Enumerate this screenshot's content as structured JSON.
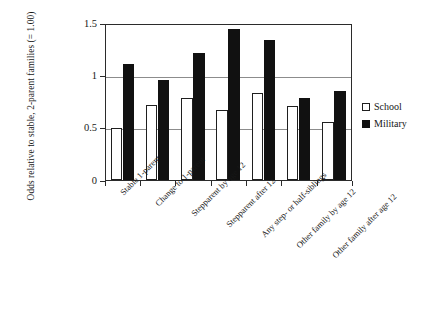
{
  "chart_data": {
    "type": "bar",
    "title": "",
    "subtitle": "",
    "xlabel": "",
    "ylabel": "Odds relative to stable, 2-parent families (= 1.00)",
    "ylim": [
      0,
      1.5
    ],
    "yticks": [
      "0",
      "0.5",
      "1",
      "1.5"
    ],
    "ytick_values": [
      0,
      0.5,
      1,
      1.5
    ],
    "grid": "horizontal",
    "legend_position": "right",
    "categories": [
      "Stable 1-parent",
      "Change  to 1-parent",
      "Stepparent by age 12",
      "Stepparent after 12",
      "Any step- or half-siblings",
      "Other family by age 12",
      "Other family after age 12"
    ],
    "series": [
      {
        "name": "School",
        "color": "#ffffff",
        "values": [
          0.5,
          0.72,
          0.78,
          0.67,
          0.83,
          0.71,
          0.55
        ]
      },
      {
        "name": "Military",
        "color": "#111111",
        "values": [
          1.11,
          0.96,
          1.21,
          1.44,
          1.34,
          0.78,
          0.85
        ]
      }
    ]
  },
  "legend": {
    "items": [
      {
        "label": "School",
        "swatch": "hollow-square-icon"
      },
      {
        "label": "Military",
        "swatch": "filled-square-icon"
      }
    ]
  }
}
